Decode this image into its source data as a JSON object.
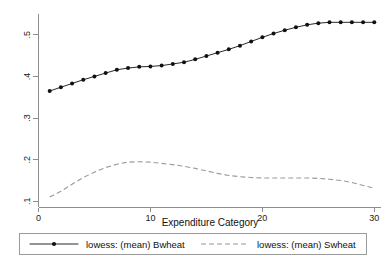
{
  "chart_data": {
    "type": "line",
    "title": "",
    "subtitle": "",
    "xlabel": "Expenditure Category",
    "ylabel": "",
    "xlim": [
      0,
      30.6
    ],
    "ylim": [
      0.085,
      0.55
    ],
    "xticks": [
      0,
      10,
      20,
      30
    ],
    "xticklabels": [
      "0",
      "10",
      "20",
      "30"
    ],
    "yticks": [
      0.1,
      0.2,
      0.3,
      0.4,
      0.5
    ],
    "yticklabels": [
      ".1",
      ".2",
      ".3",
      ".4",
      ".5"
    ],
    "ytick_rotation_degrees": 90,
    "grid": false,
    "legend_position": "below-outside",
    "legend_boxed": true,
    "x": [
      1,
      2,
      3,
      4,
      5,
      6,
      7,
      8,
      9,
      10,
      11,
      12,
      13,
      14,
      15,
      16,
      17,
      18,
      19,
      20,
      21,
      22,
      23,
      24,
      25,
      26,
      27,
      28,
      29,
      30
    ],
    "series": [
      {
        "name": "lowess: (mean) Bwheat",
        "style": "solid",
        "marker": "filled-circle",
        "color": "#111111",
        "values": [
          0.365,
          0.374,
          0.383,
          0.392,
          0.4,
          0.408,
          0.416,
          0.42,
          0.423,
          0.424,
          0.426,
          0.43,
          0.434,
          0.441,
          0.449,
          0.457,
          0.465,
          0.474,
          0.484,
          0.494,
          0.503,
          0.511,
          0.518,
          0.524,
          0.528,
          0.53,
          0.53,
          0.53,
          0.53,
          0.53
        ]
      },
      {
        "name": "lowess: (mean) Swheat",
        "style": "dashed",
        "marker": "none",
        "color": "#9a9a9a",
        "values": [
          0.11,
          0.124,
          0.141,
          0.157,
          0.17,
          0.181,
          0.189,
          0.194,
          0.195,
          0.194,
          0.191,
          0.188,
          0.184,
          0.179,
          0.173,
          0.167,
          0.162,
          0.159,
          0.157,
          0.156,
          0.156,
          0.156,
          0.156,
          0.156,
          0.155,
          0.153,
          0.15,
          0.145,
          0.138,
          0.131
        ]
      }
    ]
  },
  "axes": {
    "x_title": "Expenditure Category"
  },
  "legend": {
    "entries": [
      {
        "label": "lowess: (mean) Bwheat"
      },
      {
        "label": "lowess: (mean) Swheat"
      }
    ]
  }
}
